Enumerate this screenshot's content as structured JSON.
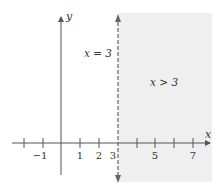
{
  "diagram": {
    "type": "number-line-inequality",
    "axes": {
      "x_label": "x",
      "y_label": "y"
    },
    "x_tick_labels": [
      "−1",
      "1",
      "2",
      "3",
      "5",
      "7"
    ],
    "x_tick_values": [
      -1,
      1,
      2,
      3,
      5,
      7
    ],
    "x_ticks_drawn": [
      -2,
      -1,
      1,
      2,
      3,
      4,
      5,
      6,
      7
    ],
    "boundary": {
      "label": "x = 3",
      "value": 3,
      "style": "dashed"
    },
    "region": {
      "label": "x > 3",
      "shade_color": "#efefef"
    },
    "colors": {
      "axis": "#555555",
      "boundary": "#666666"
    }
  }
}
